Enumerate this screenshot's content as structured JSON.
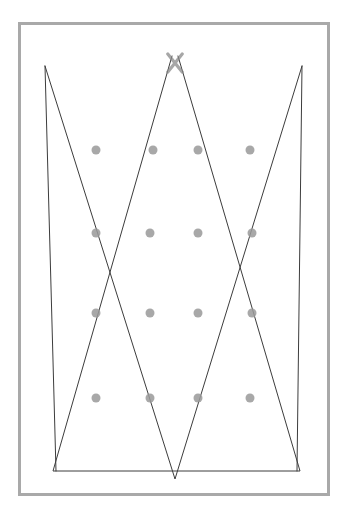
{
  "page": {
    "title": "Geometric Zigzag Line Figure",
    "width": 346,
    "height": 524,
    "background_color": "#ffffff",
    "type": "line-drawing"
  },
  "frame": {
    "name": "outer-border",
    "x": 18,
    "y": 22,
    "width": 312,
    "height": 474,
    "stroke_color": "#a9a9a9",
    "stroke_width": 3,
    "fill": "#ffffff"
  },
  "style": {
    "line_color": "#3c3c3c",
    "line_width": 1,
    "dot_color": "#9a9a9a",
    "dot_radius": 4.5,
    "dot_opacity": 0.85
  },
  "vertices": {
    "top_left": {
      "x": 45,
      "y": 66
    },
    "top_mid": {
      "x": 175,
      "y": 58
    },
    "top_right": {
      "x": 302,
      "y": 66
    },
    "bottom_left": {
      "x": 53,
      "y": 471
    },
    "bottom_mid": {
      "x": 175,
      "y": 479
    },
    "bottom_right": {
      "x": 300,
      "y": 471
    }
  },
  "polylines": [
    {
      "name": "zigzag-path-a",
      "description": "from top-left apex down-right to bottom-mid, up to top-right-ish",
      "points": [
        {
          "x": 45,
          "y": 66
        },
        {
          "x": 175,
          "y": 479
        },
        {
          "x": 302,
          "y": 66
        }
      ]
    },
    {
      "name": "zigzag-path-b",
      "description": "from top-mid down-left to bottom-left apex, across to bottom-right, back to top-mid",
      "points": [
        {
          "x": 172,
          "y": 56
        },
        {
          "x": 53,
          "y": 471
        },
        {
          "x": 300,
          "y": 471
        },
        {
          "x": 178,
          "y": 56
        }
      ]
    },
    {
      "name": "zigzag-path-c",
      "description": "from top-left apex down to bottom-left apex region",
      "points": [
        {
          "x": 45,
          "y": 66
        },
        {
          "x": 56,
          "y": 471
        }
      ]
    },
    {
      "name": "zigzag-path-d",
      "description": "from top-right apex down to bottom-right apex region",
      "points": [
        {
          "x": 302,
          "y": 66
        },
        {
          "x": 297,
          "y": 471
        }
      ]
    }
  ],
  "dot_grid": {
    "name": "intersection-dot-grid",
    "rows": 4,
    "columns": 4,
    "row_y": [
      150,
      233,
      313,
      398
    ],
    "column_x": [
      96,
      151,
      198,
      251
    ],
    "count": 16,
    "dots": [
      {
        "row": 1,
        "col": 1,
        "x": 96,
        "y": 150
      },
      {
        "row": 1,
        "col": 2,
        "x": 153,
        "y": 150
      },
      {
        "row": 1,
        "col": 3,
        "x": 198,
        "y": 150
      },
      {
        "row": 1,
        "col": 4,
        "x": 250,
        "y": 150
      },
      {
        "row": 2,
        "col": 1,
        "x": 96,
        "y": 233
      },
      {
        "row": 2,
        "col": 2,
        "x": 150,
        "y": 233
      },
      {
        "row": 2,
        "col": 3,
        "x": 198,
        "y": 233
      },
      {
        "row": 2,
        "col": 4,
        "x": 252,
        "y": 233
      },
      {
        "row": 3,
        "col": 1,
        "x": 96,
        "y": 313
      },
      {
        "row": 3,
        "col": 2,
        "x": 150,
        "y": 313
      },
      {
        "row": 3,
        "col": 3,
        "x": 198,
        "y": 313
      },
      {
        "row": 3,
        "col": 4,
        "x": 252,
        "y": 313
      },
      {
        "row": 4,
        "col": 1,
        "x": 96,
        "y": 398
      },
      {
        "row": 4,
        "col": 2,
        "x": 150,
        "y": 398
      },
      {
        "row": 4,
        "col": 3,
        "x": 198,
        "y": 398
      },
      {
        "row": 4,
        "col": 4,
        "x": 250,
        "y": 398
      }
    ]
  },
  "markers": {
    "top_x_marker": {
      "name": "top-x-crossing-marker",
      "center_x": 175,
      "center_y": 63,
      "size": 18,
      "color": "#8a8a8a"
    }
  }
}
